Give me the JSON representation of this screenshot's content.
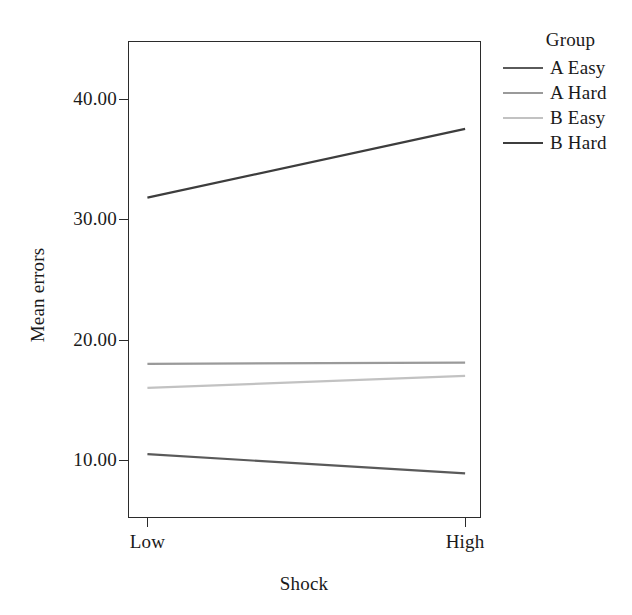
{
  "chart_data": {
    "type": "line",
    "title": "",
    "xlabel": "Shock",
    "ylabel": "Mean errors",
    "x": [
      "Low",
      "High"
    ],
    "xtick_labels": [
      "Low",
      "High"
    ],
    "ytick_labels": [
      "10.00",
      "20.00",
      "30.00",
      "40.00"
    ],
    "yticks": [
      10,
      20,
      30,
      40
    ],
    "ylim": [
      5.2,
      44.8
    ],
    "grid": false,
    "legend_position": "right",
    "legend_title": "Group",
    "series": [
      {
        "name": "A Easy",
        "values": [
          10.5,
          8.9
        ],
        "color": "#5a5a5a"
      },
      {
        "name": "A Hard",
        "values": [
          18.0,
          18.1
        ],
        "color": "#9a9a9a"
      },
      {
        "name": "B Easy",
        "values": [
          16.0,
          17.0
        ],
        "color": "#c2c2c2"
      },
      {
        "name": "B Hard",
        "values": [
          31.8,
          37.5
        ],
        "color": "#3d3d3d"
      }
    ]
  },
  "axes": {
    "y_title": "Mean errors",
    "x_title": "Shock",
    "y_ticks": [
      {
        "label": "40.00",
        "value": 40
      },
      {
        "label": "30.00",
        "value": 30
      },
      {
        "label": "20.00",
        "value": 20
      },
      {
        "label": "10.00",
        "value": 10
      }
    ],
    "x_ticks": [
      {
        "label": "Low",
        "value": 0
      },
      {
        "label": "High",
        "value": 1
      }
    ]
  },
  "legend": {
    "title": "Group",
    "items": [
      {
        "label": "A Easy",
        "color": "#5a5a5a"
      },
      {
        "label": "A Hard",
        "color": "#9a9a9a"
      },
      {
        "label": "B Easy",
        "color": "#c2c2c2"
      },
      {
        "label": "B Hard",
        "color": "#3d3d3d"
      }
    ]
  },
  "colors": {
    "axis": "#2b2b2b",
    "text": "#1a1a1a",
    "background": "#ffffff"
  }
}
